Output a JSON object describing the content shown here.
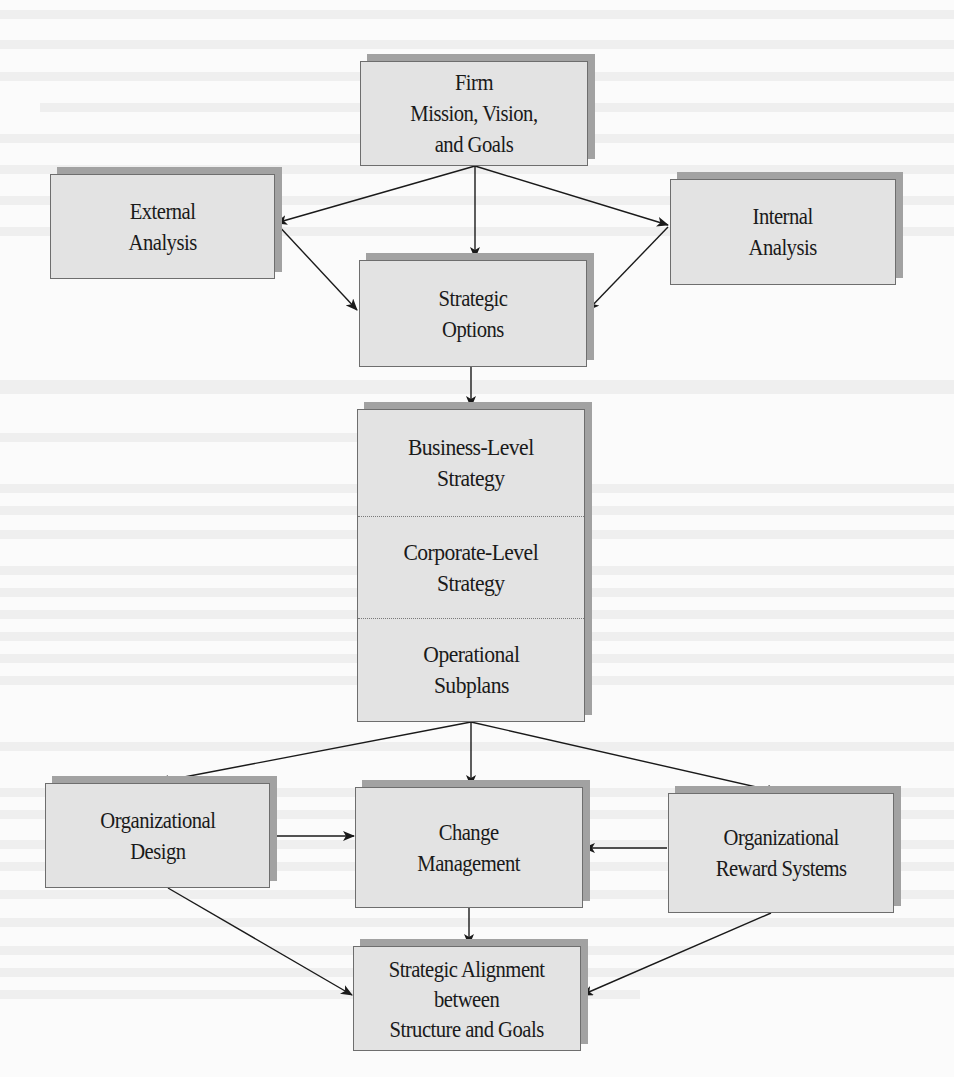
{
  "figure": {
    "type": "flowchart",
    "colors": {
      "box_fill": "#e3e3e3",
      "box_border": "#6e6e6e",
      "box_shadow": "#a2a2a2",
      "arrow": "#1a1a1a",
      "text": "#1a1a1a",
      "page_background": "#fbfbfb"
    },
    "nodes": {
      "mission": {
        "label": "Firm\nMission, Vision,\nand Goals"
      },
      "external": {
        "label": "External\nAnalysis"
      },
      "internal": {
        "label": "Internal\nAnalysis"
      },
      "options": {
        "label": "Strategic\nOptions"
      },
      "strategy_stack": {
        "sections": [
          {
            "label": "Business-Level\nStrategy"
          },
          {
            "label": "Corporate-Level\nStrategy"
          },
          {
            "label": "Operational\nSubplans"
          }
        ]
      },
      "org_design": {
        "label": "Organizational\nDesign"
      },
      "change_mgmt": {
        "label": "Change\nManagement"
      },
      "reward": {
        "label": "Organizational\nReward Systems"
      },
      "alignment": {
        "label": "Strategic Alignment\nbetween\nStructure and Goals"
      }
    },
    "edges": [
      {
        "from": "mission",
        "to": "external"
      },
      {
        "from": "mission",
        "to": "options"
      },
      {
        "from": "mission",
        "to": "internal"
      },
      {
        "from": "external",
        "to": "options"
      },
      {
        "from": "internal",
        "to": "options"
      },
      {
        "from": "options",
        "to": "strategy_stack"
      },
      {
        "from": "strategy_stack",
        "to": "org_design"
      },
      {
        "from": "strategy_stack",
        "to": "change_mgmt"
      },
      {
        "from": "strategy_stack",
        "to": "reward"
      },
      {
        "from": "org_design",
        "to": "change_mgmt"
      },
      {
        "from": "reward",
        "to": "change_mgmt"
      },
      {
        "from": "org_design",
        "to": "alignment"
      },
      {
        "from": "change_mgmt",
        "to": "alignment"
      },
      {
        "from": "reward",
        "to": "alignment"
      }
    ]
  }
}
